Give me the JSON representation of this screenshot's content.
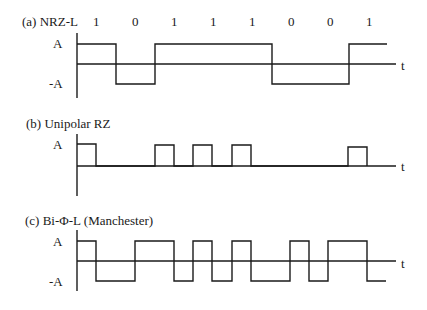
{
  "diagram": {
    "bits": [
      "1",
      "0",
      "1",
      "1",
      "1",
      "0",
      "0",
      "1"
    ],
    "panels": [
      {
        "id": "a",
        "title": "(a) NRZ-L",
        "levels": [
          "A",
          "-A"
        ],
        "time_label": "t",
        "waveform": "NRZ-L"
      },
      {
        "id": "b",
        "title": "(b) Unipolar RZ",
        "levels": [
          "A"
        ],
        "time_label": "t",
        "waveform": "Unipolar RZ"
      },
      {
        "id": "c",
        "title": "(c) Bi-Φ-L (Manchester)",
        "levels": [
          "A",
          "-A"
        ],
        "time_label": "t",
        "waveform": "Manchester"
      }
    ]
  }
}
